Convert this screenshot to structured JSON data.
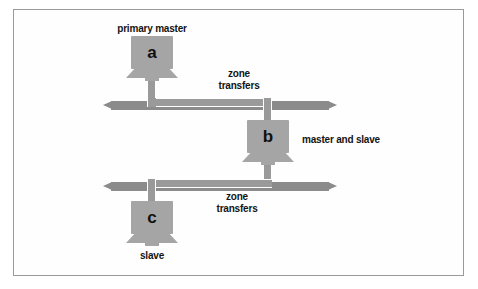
{
  "figure": {
    "background_color": "#ffffff",
    "frame_color": "#9a9a9a",
    "bus_color": "#8b8b8b",
    "computer_color": "#a5a5a5",
    "pipe_color": "#9a9a9a",
    "pipe_outline_color": "#ffffff",
    "text_color": "#141414"
  },
  "nodes": {
    "primary_master": {
      "glyph": "a",
      "label": "primary master",
      "role": "primary master"
    },
    "master_and_slave": {
      "glyph": "b",
      "label": "master and slave",
      "role": "master and slave"
    },
    "slave": {
      "glyph": "c",
      "label": "slave",
      "role": "slave"
    }
  },
  "links": {
    "upper": {
      "line1": "zone",
      "line2": "transfers"
    },
    "lower": {
      "line1": "zone",
      "line2": "transfers"
    }
  },
  "networks": {
    "upper_bus": "upper network segment",
    "lower_bus": "lower network segment"
  }
}
